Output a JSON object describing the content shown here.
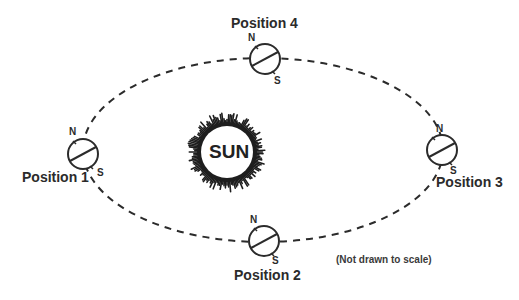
{
  "diagram": {
    "sun": {
      "label": "SUN",
      "center": [
        227,
        152
      ],
      "radius": 27
    },
    "orbit": {
      "center": [
        263,
        150
      ],
      "rx": 180,
      "ry": 92,
      "style": "dashed"
    },
    "positions": [
      {
        "id": 1,
        "label": "Position 1",
        "north": "N",
        "south": "S",
        "center": [
          83,
          154
        ]
      },
      {
        "id": 2,
        "label": "Position 2",
        "north": "N",
        "south": "S",
        "center": [
          264,
          241
        ]
      },
      {
        "id": 3,
        "label": "Position 3",
        "north": "N",
        "south": "S",
        "center": [
          442,
          150
        ]
      },
      {
        "id": 4,
        "label": "Position 4",
        "north": "N",
        "south": "S",
        "center": [
          265,
          59
        ]
      }
    ],
    "note": "(Not drawn to scale)",
    "colors": {
      "line": "#2b2b2b",
      "background": "#ffffff"
    }
  }
}
